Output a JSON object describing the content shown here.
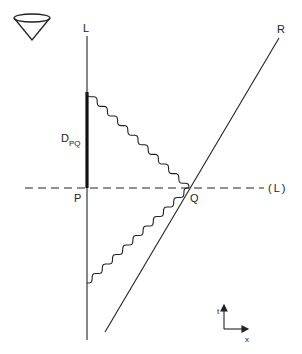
{
  "diagram": {
    "labels": {
      "worldline_L": "L",
      "worldline_R": "R",
      "event_P": "P",
      "event_Q": "Q",
      "simultaneity_line": "(L)",
      "duration_main": "D",
      "duration_sub": "PQ",
      "axis_t": "t",
      "axis_x": "x"
    },
    "colors": {
      "ink": "#222222",
      "background": "#ffffff"
    }
  }
}
